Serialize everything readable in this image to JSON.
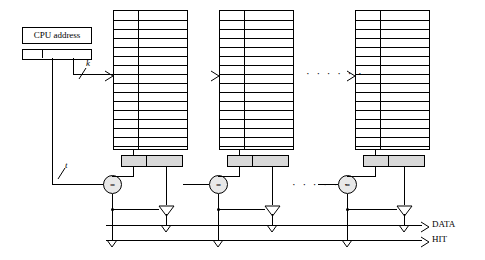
{
  "diagram": {
    "cpu_address_label": "CPU address",
    "index_label": "k",
    "tag_label": "t",
    "comparator_label": "=",
    "data_output_label": "DATA",
    "hit_output_label": "HIT",
    "ellipsis": "· · · · · ·",
    "ways": [
      {
        "name": "way-1"
      },
      {
        "name": "way-2"
      },
      {
        "name": "way-n"
      }
    ],
    "array_rows": 15,
    "array_cols": 2,
    "colors": {
      "line": "#000000",
      "bar_fill": "#d9d9d9",
      "comparator_fill": "#e8e8e8",
      "background": "#ffffff"
    }
  }
}
